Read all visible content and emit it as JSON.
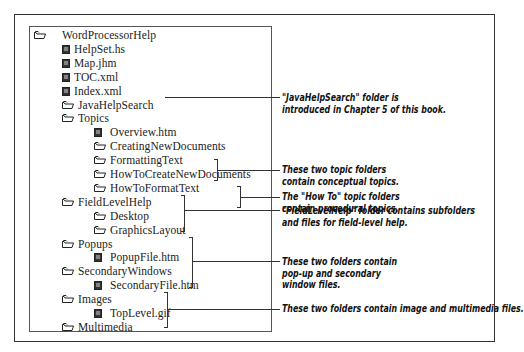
{
  "tree": [
    {
      "label": "WordProcessorHelp",
      "type": "folder",
      "level": 0
    },
    {
      "label": "HelpSet.hs",
      "type": "file",
      "level": 1
    },
    {
      "label": "Map.jhm",
      "type": "file",
      "level": 1
    },
    {
      "label": "TOC.xml",
      "type": "file",
      "level": 1
    },
    {
      "label": "Index.xml",
      "type": "file",
      "level": 1
    },
    {
      "label": "JavaHelpSearch",
      "type": "folder",
      "level": 1
    },
    {
      "label": "Topics",
      "type": "folder",
      "level": 1
    },
    {
      "label": "Overview.htm",
      "type": "file",
      "level": 2
    },
    {
      "label": "CreatingNewDocuments",
      "type": "folder",
      "level": 2
    },
    {
      "label": "FormattingText",
      "type": "folder",
      "level": 2
    },
    {
      "label": "HowToCreateNewDocuments",
      "type": "folder",
      "level": 2
    },
    {
      "label": "HowToFormatText",
      "type": "folder",
      "level": 2
    },
    {
      "label": "FieldLevelHelp",
      "type": "folder",
      "level": 1
    },
    {
      "label": "Desktop",
      "type": "folder",
      "level": 2
    },
    {
      "label": "GraphicsLayout",
      "type": "folder",
      "level": 2
    },
    {
      "label": "Popups",
      "type": "folder",
      "level": 1
    },
    {
      "label": "PopupFile.htm",
      "type": "file",
      "level": 2
    },
    {
      "label": "SecondaryWindows",
      "type": "folder",
      "level": 1
    },
    {
      "label": "SecondaryFile.htm",
      "type": "file",
      "level": 2
    },
    {
      "label": "Images",
      "type": "folder",
      "level": 1
    },
    {
      "label": "TopLevel.gif",
      "type": "file",
      "level": 2
    },
    {
      "label": "Multimedia",
      "type": "folder",
      "level": 1
    }
  ],
  "annotations": [
    {
      "line1": "\"JavaHelpSearch\" folder is",
      "line2": "introduced in Chapter 5 of this book."
    },
    {
      "line1": "These two topic folders",
      "line2": "contain conceptual topics."
    },
    {
      "line1": "The \"How To\" topic folders",
      "line2": "contain procedural topics."
    },
    {
      "line1": "\"FieldLevelHelp\" folder contains subfolders",
      "line2": "and files for field-level help."
    },
    {
      "line1": "These two folders contain",
      "line2": "pop-up and secondary",
      "line3": "window files."
    },
    {
      "line1": "These two folders contain image and multimedia files."
    }
  ],
  "icons": {
    "folder": "folder-icon",
    "file": "document-icon"
  },
  "colors": {
    "line": "#333333",
    "text": "#222222"
  }
}
